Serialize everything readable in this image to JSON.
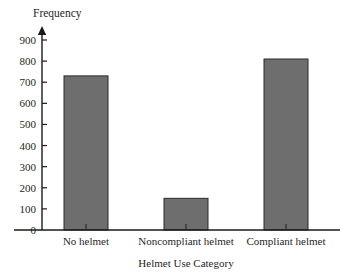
{
  "chart_data": {
    "type": "bar",
    "title": "",
    "xlabel": "Helmet Use Category",
    "ylabel": "Frequency",
    "categories": [
      "No helmet",
      "Noncompliant helmet",
      "Compliant helmet"
    ],
    "values": [
      730,
      150,
      810
    ],
    "ylim": [
      0,
      900
    ],
    "ytick_labels": [
      "0",
      "100",
      "200",
      "300",
      "400",
      "500",
      "600",
      "700",
      "800",
      "900"
    ],
    "ytick_values": [
      0,
      100,
      200,
      300,
      400,
      500,
      600,
      700,
      800,
      900
    ],
    "grid": false,
    "legend": "none",
    "bar_fill_color": "#6e6e6e",
    "bar_border_color": "#2b2b2b",
    "axis_color": "#1a1a1a",
    "background_color": "#ffffff",
    "y_axis_has_arrow": true
  },
  "axes": {
    "y_title": "Frequency",
    "x_title": "Helmet Use Category"
  }
}
